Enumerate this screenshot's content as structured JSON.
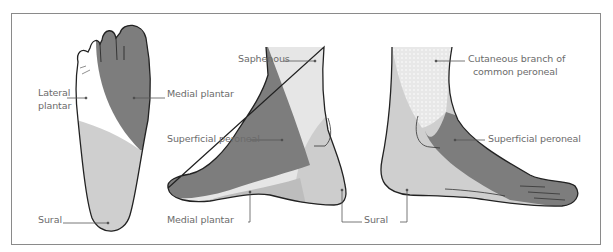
{
  "figure": {
    "type": "anatomical-diagram",
    "views": [
      {
        "name": "plantar-view",
        "labels": [
          "Lateral plantar",
          "Medial plantar",
          "Sural"
        ]
      },
      {
        "name": "medial-view",
        "labels": [
          "Saphenous",
          "Superficial peroneal",
          "Medial plantar",
          "Sural"
        ]
      },
      {
        "name": "lateral-view",
        "labels": [
          "Cutaneous branch of common peroneal",
          "Superficial peroneal"
        ]
      }
    ]
  },
  "labels": {
    "plantar_lateral_line1": "Lateral",
    "plantar_lateral_line2": "plantar",
    "plantar_medial": "Medial plantar",
    "plantar_sural": "Sural",
    "medial_saphenous": "Saphenous",
    "medial_superficial_peroneal": "Superficial peroneal",
    "medial_medial_plantar": "Medial plantar",
    "medial_sural": "Sural",
    "lateral_cutaneous_line1": "Cutaneous branch of",
    "lateral_cutaneous_line2": "common peroneal",
    "lateral_superficial_peroneal": "Superficial peroneal"
  },
  "colors": {
    "dark_region": "#7d7d7d",
    "mid_region": "#c9c9c9",
    "light_region": "#e6e6e6",
    "white_region": "#ffffff",
    "outline": "#222222",
    "leader_line": "#555555",
    "label_text": "#6b6b6b",
    "frame_border": "#8a8a8a"
  }
}
